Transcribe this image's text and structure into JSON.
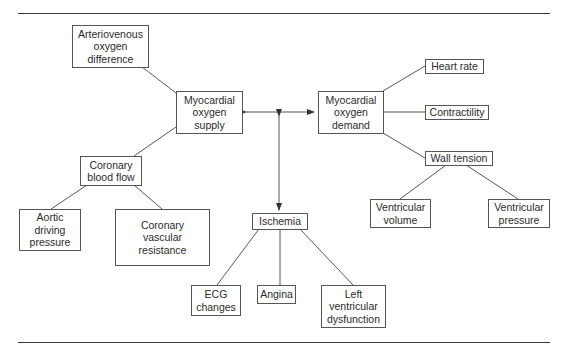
{
  "diagram": {
    "nodes": [
      {
        "id": "arteriovenous",
        "label": "Arteriovenous\noxygen\ndifference"
      },
      {
        "id": "supply",
        "label": "Myocardial\noxygen\nsupply"
      },
      {
        "id": "coronary_flow",
        "label": "Coronary\nblood flow"
      },
      {
        "id": "aortic",
        "label": "Aortic\ndriving\npressure"
      },
      {
        "id": "resistance",
        "label": "Coronary\nvascular\nresistance"
      },
      {
        "id": "demand",
        "label": "Myocardial\noxygen\ndemand"
      },
      {
        "id": "heart_rate",
        "label": "Heart rate"
      },
      {
        "id": "contractility",
        "label": "Contractility"
      },
      {
        "id": "wall_tension",
        "label": "Wall tension"
      },
      {
        "id": "vent_volume",
        "label": "Ventricular\nvolume"
      },
      {
        "id": "vent_pressure",
        "label": "Ventricular\npressure"
      },
      {
        "id": "ischemia",
        "label": "Ischemia"
      },
      {
        "id": "ecg",
        "label": "ECG\nchanges"
      },
      {
        "id": "angina",
        "label": "Angina"
      },
      {
        "id": "lv_dysfunction",
        "label": "Left\nventricular\ndysfunction"
      }
    ],
    "edges": [
      {
        "from": "arteriovenous",
        "to": "supply",
        "type": "line"
      },
      {
        "from": "coronary_flow",
        "to": "supply",
        "type": "line"
      },
      {
        "from": "coronary_flow",
        "to": "aortic",
        "type": "line"
      },
      {
        "from": "coronary_flow",
        "to": "resistance",
        "type": "line"
      },
      {
        "from": "supply",
        "to": "demand",
        "type": "double-arrow"
      },
      {
        "from": "supply-demand-link",
        "to": "ischemia",
        "type": "double-arrow"
      },
      {
        "from": "demand",
        "to": "heart_rate",
        "type": "line"
      },
      {
        "from": "demand",
        "to": "contractility",
        "type": "line"
      },
      {
        "from": "demand",
        "to": "wall_tension",
        "type": "line"
      },
      {
        "from": "wall_tension",
        "to": "vent_volume",
        "type": "line"
      },
      {
        "from": "wall_tension",
        "to": "vent_pressure",
        "type": "line"
      },
      {
        "from": "ischemia",
        "to": "ecg",
        "type": "line"
      },
      {
        "from": "ischemia",
        "to": "angina",
        "type": "line"
      },
      {
        "from": "ischemia",
        "to": "lv_dysfunction",
        "type": "line"
      }
    ]
  }
}
